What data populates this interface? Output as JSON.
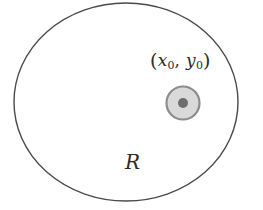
{
  "figure": {
    "kind": "geometry-diagram",
    "background_color": "#ffffff",
    "outer_circle": {
      "name": "region-boundary-circle",
      "center_x": 126,
      "center_y": 102,
      "radius_x": 112,
      "radius_y": 99,
      "stroke_color": "#4a4a4a",
      "stroke_width": 1.4,
      "fill": "none"
    },
    "inner_disk": {
      "name": "source-disk",
      "center_x": 183,
      "center_y": 103,
      "radius": 16.5,
      "stroke_color": "#8c8c8c",
      "stroke_width": 2.2,
      "fill_color": "#d9d9d9"
    },
    "center_dot": {
      "name": "source-center-dot",
      "center_x": 183,
      "center_y": 103,
      "radius": 5,
      "fill_color": "#6e6e6e"
    },
    "labels": {
      "point": {
        "open_paren": "(",
        "x_symbol": "x",
        "x_subscript": "0",
        "comma": ",",
        "y_symbol": "y",
        "y_subscript": "0",
        "close_paren": ")"
      },
      "region": "R"
    }
  }
}
